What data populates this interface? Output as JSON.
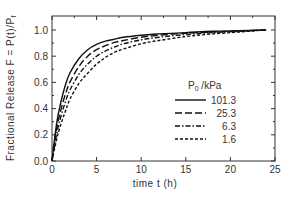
{
  "chart_data": {
    "type": "line",
    "title": "",
    "xlabel": "time  t  (h)",
    "ylabel": "Fractional  Release  F  =  P(t)/Pₓ",
    "ylabel_parts": {
      "main": "Fractional  Release  F  =  P(t)/P",
      "sub": "f"
    },
    "xlim": [
      0,
      25
    ],
    "ylim": [
      0.0,
      1.1
    ],
    "xticks": [
      0,
      5,
      10,
      15,
      20,
      25
    ],
    "xtick_labels": [
      "0",
      "5",
      "10",
      "15",
      "20",
      "25"
    ],
    "yticks": [
      0.0,
      0.2,
      0.4,
      0.6,
      0.8,
      1.0
    ],
    "ytick_labels": [
      "0.0",
      "0.2",
      "0.4",
      "0.6",
      "0.8",
      "1.0"
    ],
    "grid": false,
    "legend": {
      "title_main": "P",
      "title_sub": "0",
      "title_rest": " /kPa",
      "position": "center-right"
    },
    "x": [
      0,
      0.5,
      1,
      1.5,
      2,
      3,
      4,
      5,
      6,
      7,
      8,
      10,
      12,
      15,
      18,
      21,
      24
    ],
    "series": [
      {
        "name": "101.3",
        "style": "solid",
        "values": [
          0.0,
          0.28,
          0.45,
          0.58,
          0.67,
          0.78,
          0.85,
          0.89,
          0.915,
          0.93,
          0.945,
          0.96,
          0.97,
          0.98,
          0.99,
          0.995,
          1.0
        ]
      },
      {
        "name": "25.3",
        "style": "long-dash",
        "values": [
          0.0,
          0.24,
          0.39,
          0.51,
          0.6,
          0.72,
          0.8,
          0.85,
          0.88,
          0.905,
          0.92,
          0.945,
          0.96,
          0.975,
          0.985,
          0.993,
          1.0
        ]
      },
      {
        "name": "6.3",
        "style": "dash-dot",
        "values": [
          0.0,
          0.2,
          0.34,
          0.45,
          0.54,
          0.66,
          0.74,
          0.8,
          0.84,
          0.87,
          0.895,
          0.925,
          0.945,
          0.965,
          0.98,
          0.99,
          1.0
        ]
      },
      {
        "name": "1.6",
        "style": "short-dash",
        "values": [
          0.0,
          0.16,
          0.28,
          0.38,
          0.47,
          0.59,
          0.67,
          0.74,
          0.79,
          0.83,
          0.855,
          0.895,
          0.92,
          0.95,
          0.97,
          0.985,
          1.0
        ]
      }
    ]
  },
  "colors": {
    "line": "#111111",
    "axis": "#333333",
    "text": "#333333",
    "background": "#ffffff"
  }
}
